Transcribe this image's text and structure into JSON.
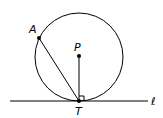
{
  "diagram": {
    "labels": {
      "A": "A",
      "P": "P",
      "T": "T",
      "line": "ℓ"
    },
    "points": {
      "A": [
        39,
        38
      ],
      "P": [
        79,
        56
      ],
      "T": [
        79,
        101
      ]
    },
    "circle": {
      "center": [
        79,
        57
      ],
      "radius": 44
    },
    "line": {
      "from": [
        10,
        101
      ],
      "to": [
        148,
        101
      ]
    },
    "right_angle_at": "T",
    "colors": {
      "stroke": "#000000",
      "background": "#ffffff"
    }
  }
}
